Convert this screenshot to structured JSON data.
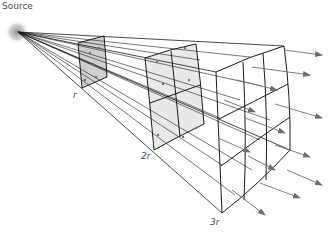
{
  "diagram": {
    "source_label": "Source",
    "distance_labels": [
      "r",
      "2r",
      "3r"
    ],
    "colors": {
      "line": "#1a1a1a",
      "face_fill_r": "#cfcfcf",
      "face_fill_2r": "#e8e8e8",
      "arrow": "#6e6e6e",
      "source_glow": "#9a9a9a"
    }
  }
}
